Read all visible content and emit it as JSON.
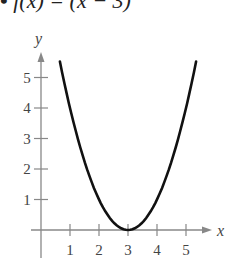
{
  "title": {
    "bullet": "•",
    "text": "f(x) = (x − 3)"
  },
  "chart_data": {
    "type": "line",
    "xlabel": "x",
    "ylabel": "y",
    "function": "(x - 3)^2",
    "x": [
      0.65,
      1,
      1.5,
      2,
      2.5,
      3,
      3.5,
      4,
      4.5,
      5,
      5.35
    ],
    "series": [
      {
        "name": "f(x)",
        "values": [
          5.52,
          4,
          2.25,
          1,
          0.25,
          0,
          0.25,
          1,
          2.25,
          4,
          5.52
        ]
      }
    ],
    "xticks": [
      "1",
      "2",
      "3",
      "4",
      "5"
    ],
    "yticks": [
      "1",
      "2",
      "3",
      "4",
      "5"
    ],
    "xlim": [
      -0.8,
      5.9
    ],
    "ylim": [
      -0.9,
      5.9
    ],
    "grid": false,
    "legend": "none",
    "colors": {
      "curve": "#111111",
      "axes": "#888888",
      "text": "#444444"
    }
  }
}
